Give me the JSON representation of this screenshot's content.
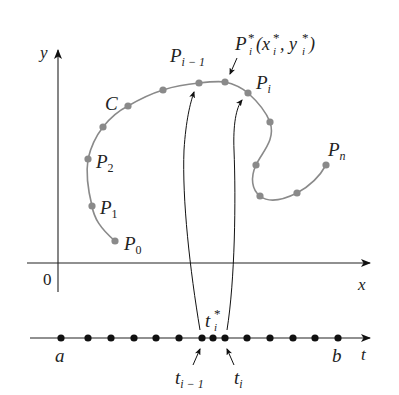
{
  "figure": {
    "type": "parametric-curve-partition",
    "colors": {
      "curve": "#8a8a8a",
      "curve_points": "#8a8a8a",
      "axes": "#222222",
      "t_points": "#111111",
      "background": "#ffffff"
    }
  },
  "axes": {
    "y_label": "y",
    "x_label": "x",
    "origin_label": "0",
    "t_label": "t"
  },
  "curve": {
    "name": "C",
    "points": [
      {
        "id": "P0",
        "x": 115,
        "y": 241,
        "label": "P",
        "sub": "0"
      },
      {
        "id": "P1",
        "x": 92,
        "y": 206,
        "label": "P",
        "sub": "1"
      },
      {
        "id": "P2",
        "x": 88,
        "y": 159,
        "label": "P",
        "sub": "2"
      },
      {
        "id": "p3",
        "x": 103,
        "y": 127
      },
      {
        "id": "p4",
        "x": 128,
        "y": 106
      },
      {
        "id": "p5",
        "x": 163,
        "y": 90
      },
      {
        "id": "Pim1",
        "x": 199,
        "y": 83,
        "label": "P",
        "sub": "i − 1"
      },
      {
        "id": "Pstar",
        "x": 225,
        "y": 82,
        "label": "P",
        "sup": "*",
        "sub": "i",
        "coords": "(x*_i, y*_i)"
      },
      {
        "id": "Pi",
        "x": 248,
        "y": 93,
        "label": "P",
        "sub": "i"
      },
      {
        "id": "p9",
        "x": 270,
        "y": 122
      },
      {
        "id": "p10",
        "x": 256,
        "y": 165
      },
      {
        "id": "p11",
        "x": 260,
        "y": 196
      },
      {
        "id": "p12",
        "x": 297,
        "y": 193
      },
      {
        "id": "Pn",
        "x": 326,
        "y": 165,
        "label": "P",
        "sub": "n"
      }
    ]
  },
  "labels": {
    "C": "C",
    "P": "P",
    "P0_sub": "0",
    "P1_sub": "1",
    "P2_sub": "2",
    "Pim1_sub": "i − 1",
    "Pi_sub": "i",
    "Pn_sub": "n",
    "Pstar_sup": "*",
    "Pstar_sub": "i",
    "Pstar_coords_open": "(x",
    "Pstar_coords_x_sup": "*",
    "Pstar_coords_x_sub": "i",
    "Pstar_coords_comma": ", y",
    "Pstar_coords_y_sup": "*",
    "Pstar_coords_y_sub": "i",
    "Pstar_coords_close": ")",
    "a": "a",
    "b": "b",
    "t": "t",
    "t_i_minus_1_sub": "i − 1",
    "t_i_sub": "i",
    "t_star_sup": "*",
    "t_star_sub": "i"
  },
  "t_axis": {
    "points_x": [
      61,
      88,
      111,
      134,
      156,
      179,
      202,
      213,
      225,
      247,
      270,
      293,
      315,
      338
    ],
    "start_label": "a",
    "end_label": "b",
    "highlighted": {
      "t_i_minus_1": 202,
      "t_star": 213,
      "t_i": 225
    }
  }
}
